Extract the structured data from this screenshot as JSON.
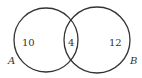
{
  "diagram": {
    "type": "venn",
    "sets": [
      {
        "name": "A",
        "only_count": "10"
      },
      {
        "name": "B",
        "only_count": "12"
      }
    ],
    "intersection_count": "4",
    "stroke_color": "#333333",
    "background": "#ffffff"
  }
}
